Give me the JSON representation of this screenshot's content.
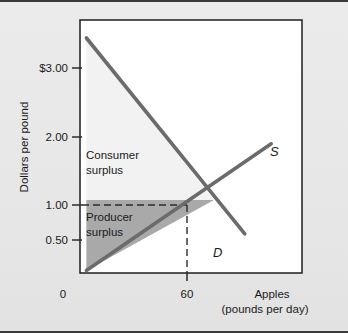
{
  "figure": {
    "name": "consumer-and-producer-surplus-diagram",
    "background_color": "#e8e8e8",
    "plot_background_color": "#ffffff",
    "border_color": "#3a3a3a"
  },
  "chart_data": {
    "type": "line",
    "title": "",
    "xlabel": "Apples",
    "xlabel_sub": "(pounds per day)",
    "ylabel": "Dollars per pound",
    "xlim": [
      0,
      100
    ],
    "ylim": [
      0,
      3.5
    ],
    "grid": false,
    "legend": "inline-curve-labels",
    "x_ticks": [
      {
        "value": 0,
        "label": "0"
      },
      {
        "value": 60,
        "label": "60"
      }
    ],
    "y_ticks": [
      {
        "value": 0.5,
        "label": "0.50"
      },
      {
        "value": 1.0,
        "label": "1.00"
      },
      {
        "value": 2.0,
        "label": "2.00"
      },
      {
        "value": 3.0,
        "label": "$3.00"
      }
    ],
    "series": [
      {
        "name": "Demand",
        "label": "D",
        "color": "#6b6b6b",
        "points": [
          {
            "x": 2,
            "y": 3.25
          },
          {
            "x": 74,
            "y": 0.53
          }
        ]
      },
      {
        "name": "Supply",
        "label": "S",
        "color": "#6b6b6b",
        "points": [
          {
            "x": 2,
            "y": 0.02
          },
          {
            "x": 86,
            "y": 1.78
          }
        ]
      }
    ],
    "equilibrium": {
      "x": 60,
      "y": 1.0,
      "price_guide": "dashed",
      "quantity_guide": "dashed"
    },
    "regions": [
      {
        "name": "consumer-surplus",
        "label_line1": "Consumer",
        "label_line2": "surplus",
        "fill": "#f2f2f2",
        "vertices": [
          [
            2,
            3.25
          ],
          [
            2,
            1.0
          ],
          [
            60,
            1.0
          ]
        ]
      },
      {
        "name": "producer-surplus",
        "label_line1": "Producer",
        "label_line2": "surplus",
        "fill": "#a9a9a9",
        "vertices": [
          [
            2,
            0.02
          ],
          [
            2,
            1.0
          ],
          [
            60,
            1.0
          ]
        ]
      }
    ],
    "annotations": [
      {
        "name": "demand-curve-label",
        "text": "D",
        "x": 78,
        "y": 0.44
      },
      {
        "name": "supply-curve-label",
        "text": "S",
        "x": 89,
        "y": 1.82
      }
    ]
  }
}
